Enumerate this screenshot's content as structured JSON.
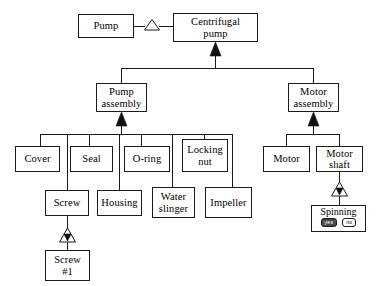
{
  "diagram": {
    "type": "product-structure-tree",
    "nodes": {
      "pump": "Pump",
      "centrifugal_pump_line1": "Centrifugal",
      "centrifugal_pump_line2": "pump",
      "pump_assembly_line1": "Pump",
      "pump_assembly_line2": "assembly",
      "motor_assembly_line1": "Motor",
      "motor_assembly_line2": "assembly",
      "cover": "Cover",
      "seal": "Seal",
      "oring": "O-ring",
      "locking_nut_line1": "Locking",
      "locking_nut_line2": "nut",
      "screw": "Screw",
      "housing": "Housing",
      "water_slinger_line1": "Water",
      "water_slinger_line2": "slinger",
      "impeller": "Impeller",
      "motor": "Motor",
      "motor_shaft_line1": "Motor",
      "motor_shaft_line2": "shaft",
      "screw1_line1": "Screw",
      "screw1_line2": "#1",
      "spinning": "Spinning"
    },
    "state_buttons": {
      "yes_label": "yes",
      "no_label": "no",
      "selected": "yes"
    },
    "colors": {
      "line": "#1a1a1a",
      "fill": "#ffffff",
      "arrow": "#111111",
      "selected_button": "#4a4a4a"
    }
  }
}
